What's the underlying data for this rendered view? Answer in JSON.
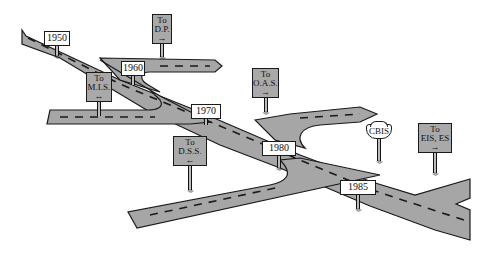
{
  "diagram": {
    "type": "roadmap-timeline-illustration",
    "colors": {
      "road_fill": "#a6a6a6",
      "road_edge": "#1a1a1a",
      "lane_dash": "#1a1a1a",
      "sign_gray": "#a9a9a9",
      "sign_white": "#ffffff",
      "background": "#ffffff"
    },
    "year_markers": [
      {
        "label": "1950"
      },
      {
        "label": "1960"
      },
      {
        "label": "1970"
      },
      {
        "label": "1980"
      },
      {
        "label": "1985"
      }
    ],
    "direction_signs": [
      {
        "line1": "To",
        "line2": "D.P.",
        "arrow": "→",
        "arrow_icon": "arrow-right-icon"
      },
      {
        "line1": "To",
        "line2": "M.I.S.",
        "arrow": "↔",
        "arrow_icon": "arrow-both-icon"
      },
      {
        "line1": "To",
        "line2": "O.A.S.",
        "arrow": "→",
        "arrow_icon": "arrow-right-icon"
      },
      {
        "line1": "To",
        "line2": "D.S.S.",
        "arrow": "←",
        "arrow_icon": "arrow-left-icon"
      },
      {
        "line1": "To",
        "line2": "EIS, ES",
        "arrow": "→",
        "arrow_icon": "arrow-right-icon"
      }
    ],
    "route_shield": {
      "label": "CBIS"
    },
    "grass_glyph": "ʷʬʷ"
  }
}
